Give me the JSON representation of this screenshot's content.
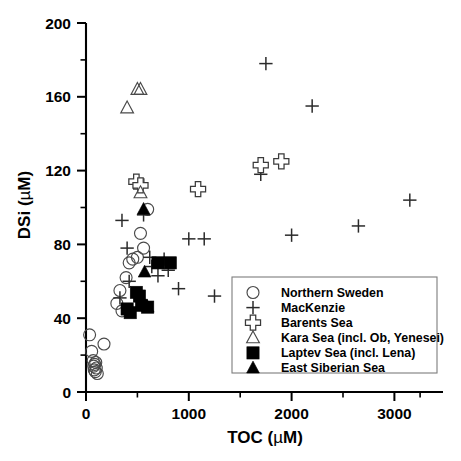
{
  "chart_data": {
    "type": "scatter",
    "title": "",
    "xlabel": "TOC (µM)",
    "ylabel": "DSi (µM)",
    "xlim": [
      -50,
      3350
    ],
    "ylim": [
      0,
      200
    ],
    "xticks": [
      0,
      1000,
      2000,
      3000
    ],
    "xticklabels": [
      "0",
      "1000",
      "2000",
      "3000"
    ],
    "xminor": [
      500,
      1500,
      2500,
      3250
    ],
    "yticks": [
      0,
      40,
      80,
      120,
      160,
      200
    ],
    "yticklabels": [
      "0",
      "40",
      "80",
      "120",
      "160",
      "200"
    ],
    "yminor": [
      20,
      60,
      100,
      140,
      180
    ],
    "grid": false,
    "legend_position": "lower right",
    "series": [
      {
        "name": "Northern Sweden",
        "marker": "circle-open",
        "points": [
          [
            35,
            31
          ],
          [
            55,
            22
          ],
          [
            70,
            17
          ],
          [
            75,
            14
          ],
          [
            80,
            12
          ],
          [
            85,
            15
          ],
          [
            90,
            11
          ],
          [
            95,
            16
          ],
          [
            100,
            13
          ],
          [
            110,
            10
          ],
          [
            175,
            26
          ],
          [
            300,
            48
          ],
          [
            330,
            55
          ],
          [
            350,
            44
          ],
          [
            390,
            62
          ],
          [
            420,
            70
          ],
          [
            455,
            72
          ],
          [
            500,
            73
          ],
          [
            530,
            86
          ],
          [
            560,
            78
          ],
          [
            600,
            99
          ]
        ]
      },
      {
        "name": "MacKenzie",
        "marker": "cross",
        "points": [
          [
            330,
            51
          ],
          [
            350,
            93
          ],
          [
            400,
            78
          ],
          [
            420,
            60
          ],
          [
            560,
            96
          ],
          [
            620,
            73
          ],
          [
            640,
            68
          ],
          [
            700,
            63
          ],
          [
            760,
            72
          ],
          [
            800,
            66
          ],
          [
            900,
            56
          ],
          [
            1000,
            83
          ],
          [
            1080,
            110
          ],
          [
            1150,
            83
          ],
          [
            1250,
            52
          ],
          [
            1700,
            118
          ],
          [
            1750,
            178
          ],
          [
            2000,
            85
          ],
          [
            2200,
            155
          ],
          [
            2650,
            90
          ],
          [
            3150,
            104
          ]
        ]
      },
      {
        "name": "Barents Sea",
        "marker": "plus-open",
        "points": [
          [
            490,
            114
          ],
          [
            530,
            112
          ],
          [
            1090,
            110
          ],
          [
            1700,
            123
          ],
          [
            1900,
            125
          ]
        ]
      },
      {
        "name": "Kara Sea (incl. Ob, Yenesei)",
        "marker": "triangle-open",
        "points": [
          [
            400,
            154
          ],
          [
            500,
            164
          ],
          [
            530,
            164
          ],
          [
            530,
            108
          ]
        ]
      },
      {
        "name": "Laptev Sea (incl. Lena)",
        "marker": "square-filled",
        "points": [
          [
            400,
            45
          ],
          [
            430,
            43
          ],
          [
            490,
            54
          ],
          [
            520,
            52
          ],
          [
            540,
            47
          ],
          [
            600,
            46
          ],
          [
            700,
            70
          ],
          [
            820,
            70
          ]
        ]
      },
      {
        "name": "East Siberian Sea",
        "marker": "triangle-filled",
        "points": [
          [
            560,
            99
          ],
          [
            570,
            65
          ],
          [
            600,
            46
          ]
        ]
      }
    ]
  },
  "legend": {
    "entries": [
      {
        "label": "Northern Sweden",
        "marker": "circle-open"
      },
      {
        "label": "MacKenzie",
        "marker": "cross"
      },
      {
        "label": "Barents Sea",
        "marker": "plus-open"
      },
      {
        "label": "Kara Sea (incl. Ob, Yenesei)",
        "marker": "triangle-open"
      },
      {
        "label": "Laptev Sea (incl. Lena)",
        "marker": "square-filled"
      },
      {
        "label": "East Siberian Sea",
        "marker": "triangle-filled"
      }
    ]
  },
  "axis_titles": {
    "x_main": "TOC (",
    "x_mu": "µ",
    "x_end": "M)",
    "y_main": "DSi (",
    "y_mu": "µ",
    "y_end": "M)"
  }
}
